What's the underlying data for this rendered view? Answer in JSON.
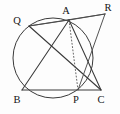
{
  "figure": {
    "background_color": "#fdfdfd",
    "line_color": "#3a3a3a",
    "label_color": "#141414",
    "width": 120,
    "height": 114
  },
  "labels": {
    "Q": "Q",
    "A": "A",
    "R": "R",
    "B": "B",
    "P": "P",
    "C": "C"
  },
  "geometry": {
    "circle": {
      "center_x": 53,
      "center_y": 58,
      "radius": 40
    },
    "points": {
      "Q": {
        "x": 29,
        "y": 26
      },
      "A": {
        "x": 69,
        "y": 20
      },
      "R": {
        "x": 105,
        "y": 14
      },
      "B": {
        "x": 22,
        "y": 90
      },
      "P": {
        "x": 78,
        "y": 90
      },
      "C": {
        "x": 101,
        "y": 90
      }
    },
    "segments": [
      {
        "name": "segment-QA",
        "from": "Q",
        "to": "A",
        "style": "solid"
      },
      {
        "name": "segment-AR",
        "from": "A",
        "to": "R",
        "style": "solid"
      },
      {
        "name": "segment-QR",
        "from": "Q",
        "to": "R",
        "style": "solid"
      },
      {
        "name": "segment-AB",
        "from": "A",
        "to": "B",
        "style": "solid"
      },
      {
        "name": "segment-AC",
        "from": "A",
        "to": "C",
        "style": "solid"
      },
      {
        "name": "segment-BC",
        "from": "B",
        "to": "C",
        "style": "solid"
      },
      {
        "name": "segment-QC",
        "from": "Q",
        "to": "C",
        "style": "solid"
      },
      {
        "name": "segment-RP",
        "from": "R",
        "to": "P",
        "style": "solid"
      },
      {
        "name": "segment-AP",
        "from": "A",
        "to": "P",
        "style": "dashed"
      }
    ],
    "label_positions": {
      "Q": {
        "x": 17,
        "y": 24
      },
      "A": {
        "x": 66,
        "y": 14
      },
      "R": {
        "x": 108,
        "y": 11
      },
      "B": {
        "x": 17,
        "y": 103
      },
      "P": {
        "x": 76,
        "y": 103
      },
      "C": {
        "x": 101,
        "y": 103
      }
    }
  }
}
